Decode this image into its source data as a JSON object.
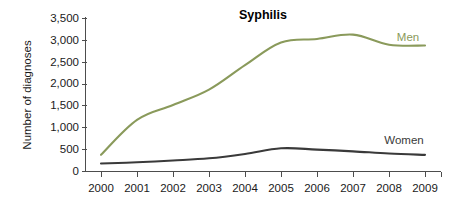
{
  "chart_data": {
    "type": "line",
    "title": "Syphilis",
    "xlabel": "",
    "ylabel": "Number of diagnoses",
    "x": [
      2000,
      2001,
      2002,
      2003,
      2004,
      2005,
      2006,
      2007,
      2008,
      2009
    ],
    "categories": [
      "2000",
      "2001",
      "2002",
      "2003",
      "2004",
      "2005",
      "2006",
      "2007",
      "2008",
      "2009"
    ],
    "series": [
      {
        "name": "Men",
        "color": "#8a9a5b",
        "values": [
          370,
          1170,
          1510,
          1860,
          2420,
          2940,
          3020,
          3120,
          2890,
          2870
        ]
      },
      {
        "name": "Women",
        "color": "#3a3a3a",
        "values": [
          170,
          200,
          240,
          290,
          390,
          520,
          490,
          450,
          400,
          370
        ]
      }
    ],
    "ylim": [
      0,
      3500
    ],
    "yticks": [
      0,
      500,
      1000,
      1500,
      2000,
      2500,
      3000,
      3500
    ],
    "ytick_labels": [
      "0",
      "500",
      "1,000",
      "1,500",
      "2,000",
      "2,500",
      "3,000",
      "3,500"
    ],
    "xtick_labels": [
      "2000",
      "2001",
      "2002",
      "2003",
      "2004",
      "2005",
      "2006",
      "2007",
      "2008",
      "2009"
    ],
    "grid": false,
    "legend_position": "inline-right"
  },
  "labels": {
    "title": "Syphilis",
    "y_axis_title": "Number of diagnoses",
    "men": "Men",
    "women": "Women"
  },
  "colors": {
    "men_line": "#8a9a5b",
    "women_line": "#3a3a3a",
    "axis": "#4d4d4d",
    "text": "#1a1a1a",
    "background": "#ffffff"
  }
}
